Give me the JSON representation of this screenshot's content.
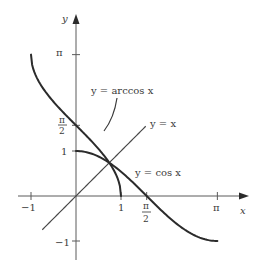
{
  "chart_data": {
    "type": "line",
    "title": "",
    "xlabel": "x",
    "ylabel": "y",
    "xlim": [
      -1,
      3.5
    ],
    "ylim": [
      -1.2,
      3.5
    ],
    "grid": false,
    "x_ticks": [
      {
        "value": -1,
        "label": "−1"
      },
      {
        "value": 1,
        "label": "1"
      },
      {
        "value": 1.5708,
        "label_num": "π",
        "label_den": "2"
      },
      {
        "value": 3.1416,
        "label": "π"
      }
    ],
    "y_ticks": [
      {
        "value": 3.1416,
        "label": "π"
      },
      {
        "value": 1.5708,
        "label_num": "π",
        "label_den": "2"
      },
      {
        "value": 1,
        "label": "1"
      },
      {
        "value": -1,
        "label": "−1"
      }
    ],
    "series": [
      {
        "name": "y = arccos x",
        "function": "arccos",
        "domain": [
          -1,
          1
        ]
      },
      {
        "name": "y = x",
        "function": "identity",
        "domain": [
          -0.75,
          1.55
        ]
      },
      {
        "name": "y = cos x",
        "function": "cos",
        "domain": [
          0,
          3.1416
        ]
      }
    ],
    "annotations": [
      {
        "text": "y = arccos x",
        "points_to": "arccos curve"
      },
      {
        "text": "y = x",
        "points_to": "identity line"
      },
      {
        "text": "y = cos x",
        "points_to": "cos curve"
      },
      {
        "text": "intersection",
        "x": 0.739,
        "y": 0.739
      }
    ]
  },
  "labels": {
    "x_axis": "x",
    "y_axis": "y",
    "arccos": "y = arccos x",
    "identity": "y = x",
    "cos": "y = cos x",
    "pi": "π",
    "two": "2",
    "one": "1",
    "neg_one": "−1"
  },
  "layout": {
    "origin_px": [
      76,
      196
    ],
    "unit_px": 45
  }
}
